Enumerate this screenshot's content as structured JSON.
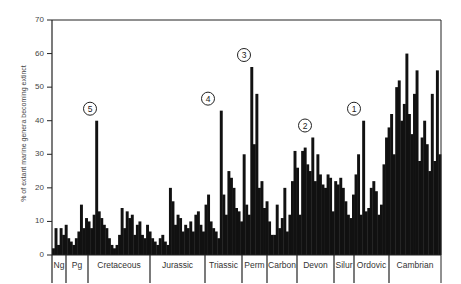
{
  "chart_data": {
    "type": "bar",
    "title": "",
    "xlabel": "",
    "ylabel": "% of extant marine genera becoming extinct",
    "ylim": [
      0,
      70
    ],
    "yticks": [
      0,
      10,
      20,
      30,
      40,
      50,
      60,
      70
    ],
    "grid": false,
    "periods": [
      {
        "label": "Ng",
        "x0": 52,
        "x1": 66
      },
      {
        "label": "Pg",
        "x0": 66,
        "x1": 88
      },
      {
        "label": "Cretaceous",
        "x0": 88,
        "x1": 150
      },
      {
        "label": "Jurassic",
        "x0": 150,
        "x1": 205
      },
      {
        "label": "Triassic",
        "x0": 205,
        "x1": 242
      },
      {
        "label": "Perm",
        "x0": 242,
        "x1": 267
      },
      {
        "label": "Carbon",
        "x0": 267,
        "x1": 297
      },
      {
        "label": "Devon",
        "x0": 297,
        "x1": 334
      },
      {
        "label": "Silur",
        "x0": 334,
        "x1": 354
      },
      {
        "label": "Ordovic",
        "x0": 354,
        "x1": 389
      },
      {
        "label": "Cambrian",
        "x0": 389,
        "x1": 441
      }
    ],
    "annotations": [
      {
        "label": "1",
        "value": 40,
        "x": 354
      },
      {
        "label": "2",
        "value": 35,
        "x": 305
      },
      {
        "label": "3",
        "value": 56,
        "x": 244
      },
      {
        "label": "4",
        "value": 43,
        "x": 208
      },
      {
        "label": "5",
        "value": 40,
        "x": 90
      }
    ],
    "values": [
      2,
      8,
      3,
      8,
      6,
      9,
      5,
      4,
      3,
      5,
      7,
      15,
      8,
      11,
      10,
      8,
      12,
      40,
      13,
      11,
      9,
      8,
      5,
      3,
      2,
      3,
      6,
      14,
      8,
      13,
      11,
      12,
      6,
      9,
      10,
      6,
      5,
      9,
      7,
      5,
      4,
      3,
      5,
      6,
      4,
      3,
      20,
      16,
      9,
      12,
      11,
      7,
      9,
      8,
      10,
      7,
      12,
      13,
      9,
      7,
      15,
      18,
      10,
      8,
      7,
      5,
      43,
      18,
      12,
      25,
      23,
      20,
      14,
      13,
      10,
      30,
      15,
      12,
      56,
      33,
      48,
      20,
      22,
      14,
      16,
      10,
      6,
      6,
      15,
      8,
      11,
      20,
      7,
      12,
      22,
      31,
      26,
      12,
      31,
      32,
      27,
      25,
      35,
      22,
      30,
      24,
      21,
      20,
      24,
      23,
      13,
      22,
      21,
      23,
      20,
      16,
      12,
      11,
      18,
      24,
      30,
      12,
      40,
      13,
      14,
      20,
      22,
      19,
      12,
      15,
      27,
      35,
      38,
      42,
      30,
      50,
      52,
      40,
      45,
      60,
      42,
      36,
      48,
      55,
      28,
      35,
      40,
      33,
      25,
      48,
      28,
      55,
      30
    ]
  }
}
